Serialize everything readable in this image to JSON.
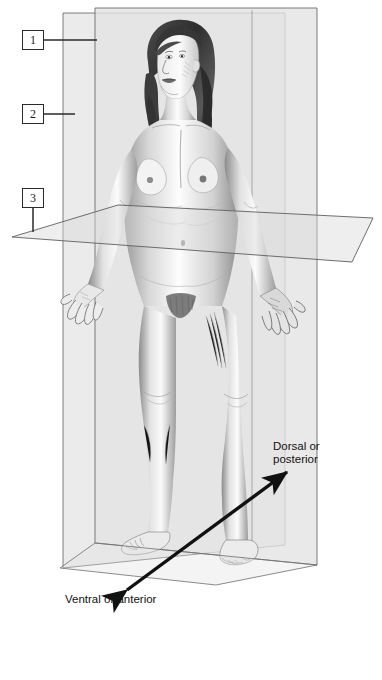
{
  "figure": {
    "background_color": "#ffffff",
    "plane_fill": "#e6e6e6",
    "plane_fill_light": "#efefef",
    "plane_stroke": "#6e6e6e",
    "ink_color": "#1a1a1a"
  },
  "callouts": [
    {
      "id": "1",
      "number": "1",
      "plane": "median-sagittal-plane"
    },
    {
      "id": "2",
      "number": "2",
      "plane": "frontal-coronal-plane"
    },
    {
      "id": "3",
      "number": "3",
      "plane": "transverse-horizontal-plane"
    }
  ],
  "direction_labels": {
    "dorsal": "Dorsal or\nposterior",
    "ventral": "Ventral or anterior"
  },
  "arrow": {
    "name": "ventral-dorsal-axis-arrow",
    "style": "double-headed",
    "color": "#111111"
  }
}
